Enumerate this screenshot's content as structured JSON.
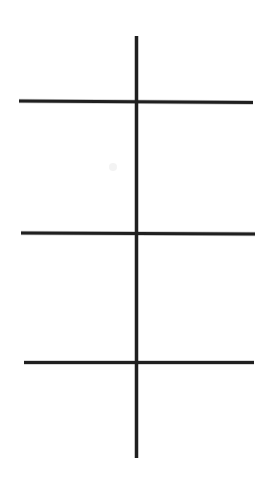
{
  "document": {
    "title": "Hand-drawn line diagram",
    "description": "A vertical line crossed by three horizontal lines",
    "background_color": "#ffffff",
    "width": 269,
    "height": 489
  },
  "figure": {
    "ink_color": "#1c1c1c",
    "ink_color_soft": "#2a2a2a",
    "artifact_color": "#e8e8e8",
    "stroke_width": 3,
    "elements": [
      {
        "name": "vertical-line",
        "role": "vertical axis stroke",
        "x1": 136.5,
        "y1": 36,
        "x2": 136.5,
        "y2": 458,
        "length": 422,
        "orientation": "vertical",
        "stroke_width": 3.2
      },
      {
        "name": "horizontal-line-top",
        "role": "upper crossbar stroke",
        "x1": 19,
        "y1": 101,
        "x2": 253,
        "y2": 102.5,
        "length": 234,
        "orientation": "horizontal",
        "stroke_width": 3.0
      },
      {
        "name": "horizontal-line-middle",
        "role": "middle crossbar stroke",
        "x1": 21,
        "y1": 233,
        "x2": 255,
        "y2": 234,
        "length": 234,
        "orientation": "horizontal",
        "stroke_width": 3.0
      },
      {
        "name": "horizontal-line-bottom",
        "role": "lower crossbar stroke",
        "x1": 24,
        "y1": 362.5,
        "x2": 254,
        "y2": 362.5,
        "length": 230,
        "orientation": "horizontal",
        "stroke_width": 3.0
      }
    ],
    "intersections": [
      {
        "name": "intersection-top",
        "x": 136.5,
        "y": 101.5
      },
      {
        "name": "intersection-middle",
        "x": 136.5,
        "y": 233.5
      },
      {
        "name": "intersection-bottom",
        "x": 136.5,
        "y": 362.5
      }
    ],
    "artifacts": [
      {
        "name": "scan-speck",
        "x": 113,
        "y": 167,
        "radius": 4,
        "opacity": 0.35
      }
    ]
  }
}
